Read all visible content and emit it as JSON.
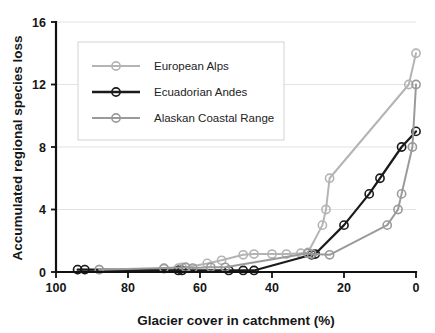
{
  "chart_data": {
    "type": "line",
    "title": "",
    "xlabel": "Glacier cover in catchment (%)",
    "ylabel": "Accumulated regional species loss",
    "xlim": [
      100,
      0
    ],
    "ylim": [
      0,
      16
    ],
    "x_reversed": true,
    "xticks": [
      100,
      80,
      60,
      40,
      20,
      0
    ],
    "yticks": [
      0,
      4,
      8,
      12,
      16
    ],
    "xtick_labels": [
      "100",
      "80",
      "60",
      "40",
      "20",
      "0"
    ],
    "ytick_labels": [
      "0",
      "4",
      "8",
      "12",
      "16"
    ],
    "grid": "horizontal",
    "legend_position": "upper-left-inset",
    "marker": "open-circle",
    "series": [
      {
        "name": "European Alps",
        "color": "#b4b4b4",
        "line_width": 2.0,
        "points": [
          [
            94,
            0.15
          ],
          [
            92,
            0.15
          ],
          [
            88,
            0.15
          ],
          [
            70,
            0.2
          ],
          [
            66,
            0.25
          ],
          [
            65,
            0.3
          ],
          [
            64,
            0.3
          ],
          [
            58,
            0.55
          ],
          [
            54,
            0.75
          ],
          [
            48,
            1.1
          ],
          [
            45,
            1.15
          ],
          [
            40,
            1.15
          ],
          [
            36,
            1.15
          ],
          [
            32,
            1.2
          ],
          [
            30,
            1.25
          ],
          [
            26,
            3.0
          ],
          [
            25,
            4.0
          ],
          [
            24,
            6.0
          ],
          [
            2,
            12.0
          ],
          [
            0,
            14.0
          ]
        ]
      },
      {
        "name": "Ecuadorian Andes",
        "color": "#1a1a1a",
        "line_width": 2.2,
        "points": [
          [
            94,
            0.15
          ],
          [
            92,
            0.15
          ],
          [
            66,
            0.1
          ],
          [
            65,
            0.1
          ],
          [
            52,
            0.1
          ],
          [
            48,
            0.1
          ],
          [
            45,
            0.1
          ],
          [
            29,
            1.1
          ],
          [
            28,
            1.15
          ],
          [
            20,
            3.0
          ],
          [
            13,
            5.0
          ],
          [
            10,
            6.0
          ],
          [
            4,
            8.0
          ],
          [
            0,
            9.0
          ]
        ]
      },
      {
        "name": "Alaskan Coastal Range",
        "color": "#9a9a9a",
        "line_width": 2.0,
        "points": [
          [
            88,
            0.15
          ],
          [
            70,
            0.25
          ],
          [
            64,
            0.3
          ],
          [
            62,
            0.25
          ],
          [
            57,
            0.3
          ],
          [
            53,
            0.3
          ],
          [
            30,
            1.2
          ],
          [
            29,
            1.15
          ],
          [
            24,
            1.1
          ],
          [
            8,
            3.0
          ],
          [
            5,
            4.0
          ],
          [
            4,
            5.0
          ],
          [
            1,
            8.0
          ],
          [
            0,
            12.0
          ]
        ]
      }
    ]
  },
  "legend": {
    "entries": [
      {
        "label": "European Alps",
        "color": "#b4b4b4"
      },
      {
        "label": "Ecuadorian Andes",
        "color": "#1a1a1a"
      },
      {
        "label": "Alaskan Coastal Range",
        "color": "#9a9a9a"
      }
    ]
  },
  "axes": {
    "x_title": "Glacier cover in catchment (%)",
    "y_title": "Accumulated regional species loss"
  }
}
